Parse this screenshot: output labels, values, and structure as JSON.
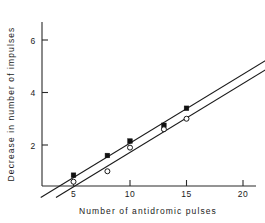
{
  "chart_data": {
    "type": "scatter",
    "title": "",
    "xlabel": "Number of antidromic pulses",
    "ylabel": "Decrease in number of impulses",
    "xlim": [
      0,
      22.8
    ],
    "ylim": [
      0,
      7.1
    ],
    "xticks": [
      5,
      10,
      15,
      20
    ],
    "xtick_labels": [
      "5",
      "10",
      "15",
      "20"
    ],
    "yticks": [
      2,
      4,
      6
    ],
    "ytick_labels": [
      "2",
      "4",
      "6"
    ],
    "grid": false,
    "legend": "none",
    "series": [
      {
        "name": "filled-squares",
        "marker": "filled-square",
        "x": [
          5,
          8,
          10,
          13,
          15
        ],
        "y": [
          0.85,
          1.6,
          2.15,
          2.75,
          3.4
        ]
      },
      {
        "name": "open-circles",
        "marker": "open-circle",
        "x": [
          5,
          8,
          10,
          13,
          15
        ],
        "y": [
          0.6,
          1.0,
          1.9,
          2.6,
          3.0
        ]
      }
    ],
    "fit_lines": [
      {
        "name": "upper-regression-line",
        "x_start": 2.1,
        "y_start": 0.0,
        "x_end": 22.5,
        "y_end": 5.35
      },
      {
        "name": "lower-regression-line",
        "x_start": 3.45,
        "y_start": 0.0,
        "x_end": 22.5,
        "y_end": 5.0
      }
    ]
  },
  "axes": {
    "x_title": "Number of antidromic pulses",
    "y_title": "Decrease in number of impulses"
  },
  "tick_text": {
    "x": [
      "5",
      "10",
      "15",
      "20"
    ],
    "y": [
      "2",
      "4",
      "6"
    ]
  }
}
